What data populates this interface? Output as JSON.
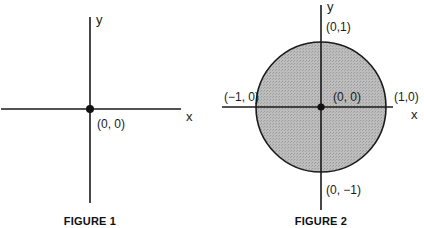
{
  "figures": [
    {
      "caption": "FIGURE 1",
      "axis_labels": {
        "x": "x",
        "y": "y"
      },
      "points": [
        {
          "label": "(0, 0)",
          "x": 0,
          "y": 0
        }
      ]
    },
    {
      "caption": "FIGURE 2",
      "axis_labels": {
        "x": "x",
        "y": "y"
      },
      "shape": "filled unit disk centered at origin",
      "fill_color": "#b3b3b3",
      "points": [
        {
          "label": "(0,1)",
          "x": 0,
          "y": 1
        },
        {
          "label": "(−1, 0)",
          "x": -1,
          "y": 0
        },
        {
          "label": "(0, 0)",
          "x": 0,
          "y": 0
        },
        {
          "label": "(1,0)",
          "x": 1,
          "y": 0
        },
        {
          "label": "(0, −1)",
          "x": 0,
          "y": -1
        }
      ]
    }
  ],
  "colors": {
    "line": "#1a1a1a",
    "disk_fill": "#b3b3b3",
    "background": "#ffffff"
  }
}
